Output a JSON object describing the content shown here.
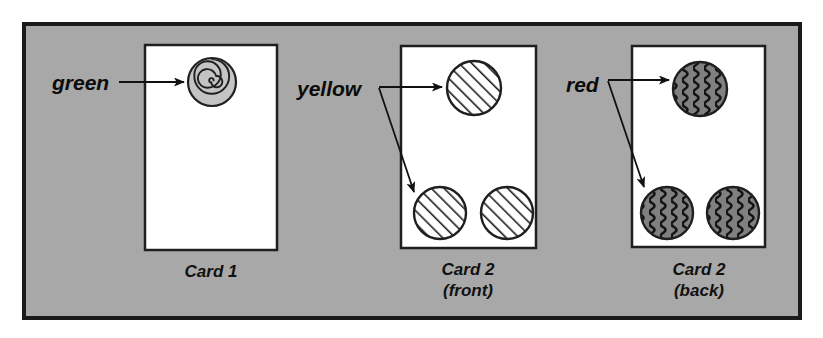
{
  "figure": {
    "type": "diagram",
    "canvas": {
      "width": 823,
      "height": 338
    },
    "panel": {
      "name": "figure-panel",
      "x": 24,
      "y": 24,
      "width": 776,
      "height": 294,
      "fill": "#a8a8a8",
      "border_color": "#1a1a1a",
      "border_width": 4
    },
    "cards": [
      {
        "id": "card-1",
        "caption_lines": [
          "Card 1"
        ],
        "x": 145,
        "y": 45,
        "width": 132,
        "height": 205,
        "fill": "#ffffff",
        "border_color": "#1f1f1f",
        "circles": [
          {
            "id": "card1-circle-top",
            "cx": 212,
            "cy": 82,
            "r": 24,
            "pattern": "spiral",
            "fill": "#c4c4c4",
            "stroke": "#1f1f1f"
          }
        ]
      },
      {
        "id": "card-2-front",
        "caption_lines": [
          "Card 2",
          "(front)"
        ],
        "x": 401,
        "y": 46,
        "width": 135,
        "height": 202,
        "fill": "#ffffff",
        "border_color": "#1f1f1f",
        "circles": [
          {
            "id": "card2front-circle-top",
            "cx": 474,
            "cy": 88,
            "r": 27,
            "pattern": "diagonal-hatch",
            "fill": "#ffffff",
            "stroke": "#1f1f1f"
          },
          {
            "id": "card2front-circle-bottom-left",
            "cx": 440,
            "cy": 213,
            "r": 26,
            "pattern": "diagonal-hatch",
            "fill": "#ffffff",
            "stroke": "#1f1f1f"
          },
          {
            "id": "card2front-circle-bottom-right",
            "cx": 507,
            "cy": 213,
            "r": 26,
            "pattern": "diagonal-hatch",
            "fill": "#ffffff",
            "stroke": "#1f1f1f"
          }
        ]
      },
      {
        "id": "card-2-back",
        "caption_lines": [
          "Card 2",
          "(back)"
        ],
        "x": 632,
        "y": 46,
        "width": 133,
        "height": 201,
        "fill": "#ffffff",
        "border_color": "#1f1f1f",
        "circles": [
          {
            "id": "card2back-circle-top",
            "cx": 700,
            "cy": 89,
            "r": 27,
            "pattern": "wavy-vertical",
            "fill": "#808080",
            "stroke": "#1f1f1f"
          },
          {
            "id": "card2back-circle-bottom-left",
            "cx": 667,
            "cy": 213,
            "r": 26,
            "pattern": "wavy-vertical",
            "fill": "#808080",
            "stroke": "#1f1f1f"
          },
          {
            "id": "card2back-circle-bottom-right",
            "cx": 733,
            "cy": 213,
            "r": 26,
            "pattern": "wavy-vertical",
            "fill": "#808080",
            "stroke": "#1f1f1f"
          }
        ]
      }
    ],
    "annotations": [
      {
        "id": "annotation-green",
        "label": "green",
        "label_x": 52,
        "label_y": 90,
        "arrows": [
          {
            "id": "arrow-green-to-card1-top",
            "x1": 119,
            "y1": 82,
            "x2": 184,
            "y2": 82
          }
        ]
      },
      {
        "id": "annotation-yellow",
        "label": "yellow",
        "label_x": 297,
        "label_y": 96,
        "arrows": [
          {
            "id": "arrow-yellow-to-top",
            "x1": 379,
            "y1": 87,
            "x2": 442,
            "y2": 87
          },
          {
            "id": "arrow-yellow-to-bottom-left",
            "x1": 379,
            "y1": 88,
            "x2": 414,
            "y2": 192
          }
        ]
      },
      {
        "id": "annotation-red",
        "label": "red",
        "label_x": 566,
        "label_y": 92,
        "arrows": [
          {
            "id": "arrow-red-to-top",
            "x1": 608,
            "y1": 80,
            "x2": 669,
            "y2": 80
          },
          {
            "id": "arrow-red-to-bottom-left",
            "x1": 608,
            "y1": 81,
            "x2": 644,
            "y2": 187
          }
        ]
      }
    ],
    "captions": [
      {
        "id": "caption-card-1",
        "lines": [
          "Card 1"
        ],
        "cx": 211,
        "y": 277
      },
      {
        "id": "caption-card-2-front",
        "lines": [
          "Card 2",
          "(front)"
        ],
        "cx": 468,
        "y": 275
      },
      {
        "id": "caption-card-2-back",
        "lines": [
          "Card 2",
          "(back)"
        ],
        "cx": 699,
        "y": 275
      }
    ],
    "colors": {
      "panel_background": "#a8a8a8",
      "card_background": "#ffffff",
      "ink": "#1a1a1a",
      "spiral_fill": "#c4c4c4",
      "wavy_fill": "#808080"
    }
  }
}
